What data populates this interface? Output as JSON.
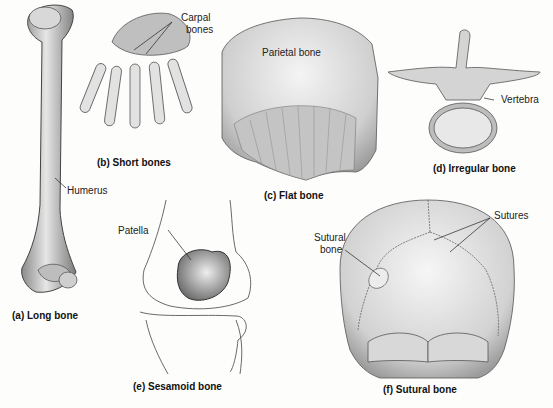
{
  "figure": {
    "panels": [
      {
        "id": "a",
        "caption": "(a) Long bone",
        "labels": [
          "Humerus"
        ]
      },
      {
        "id": "b",
        "caption": "(b) Short bones",
        "labels": [
          "Carpal",
          "bones"
        ]
      },
      {
        "id": "c",
        "caption": "(c) Flat bone",
        "labels": [
          "Parietal bone"
        ]
      },
      {
        "id": "d",
        "caption": "(d) Irregular bone",
        "labels": [
          "Vertebra"
        ]
      },
      {
        "id": "e",
        "caption": "(e) Sesamoid bone",
        "labels": [
          "Patella"
        ]
      },
      {
        "id": "f",
        "caption": "(f) Sutural bone",
        "labels": [
          "Sutures",
          "Sutural",
          "bone"
        ]
      }
    ]
  }
}
